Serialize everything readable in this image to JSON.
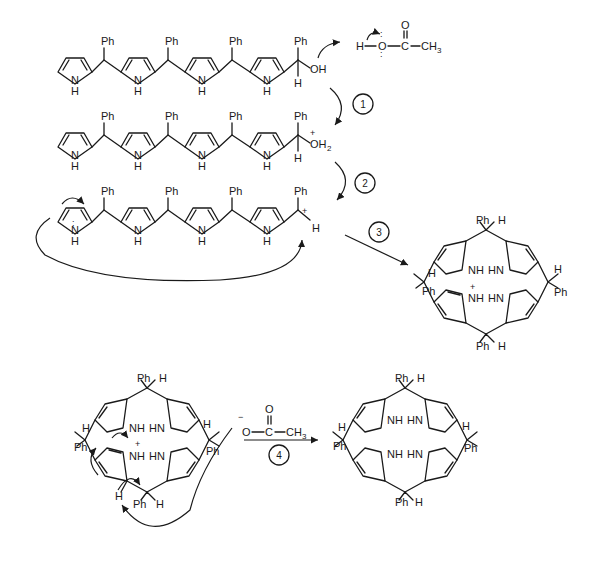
{
  "diagram": {
    "labels": {
      "ph": "Ph",
      "h": "H",
      "n": "N",
      "nh": "NH",
      "hn": "HN",
      "oh": "OH",
      "oh2_o": "OH",
      "oh2_sub": "2",
      "plus": "+",
      "minus": "−",
      "o": "O",
      "c": "C",
      "ch3": "CH",
      "ch3_sub": "3",
      "lone_pair": ":"
    },
    "reagents": {
      "acetic_acid": "H–O–C(=O)–CH3",
      "acetate": "−O–C(=O)–CH3"
    },
    "steps": [
      {
        "id": 1,
        "label": "1",
        "description": "Protonation of hydroxyl by acetic acid"
      },
      {
        "id": 2,
        "label": "2",
        "description": "Loss of water to give carbocation"
      },
      {
        "id": 3,
        "label": "3",
        "description": "Intramolecular attack / ring closure"
      },
      {
        "id": 4,
        "label": "4",
        "description": "Deprotonation by acetate giving porphyrinogen"
      }
    ],
    "structures": [
      {
        "id": "tetrapyrrole-carbinol",
        "row": 1
      },
      {
        "id": "protonated-carbinol",
        "row": 2
      },
      {
        "id": "carbocation",
        "row": 3
      },
      {
        "id": "cyclized-cation",
        "row": 3
      },
      {
        "id": "cyclized-cation-deprotonation",
        "row": 4
      },
      {
        "id": "porphyrinogen",
        "row": 4
      }
    ]
  }
}
